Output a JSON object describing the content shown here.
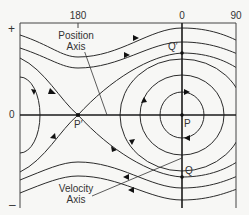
{
  "diagram": {
    "type": "phase-portrait",
    "top_axis_labels": {
      "left": "180",
      "center": "0",
      "right": "90"
    },
    "left_axis_labels": {
      "top": "+",
      "middle": "0",
      "bottom": "–"
    },
    "annotations": {
      "position_axis": [
        "Position",
        "Axis"
      ],
      "velocity_axis": [
        "Velocity",
        "Axis"
      ]
    },
    "points": {
      "p_prime": "P′",
      "p": "P",
      "q_prime": "Q′",
      "q": "Q"
    },
    "colors": {
      "line": "#2b2b2b",
      "background": "#f7f7f5"
    }
  }
}
